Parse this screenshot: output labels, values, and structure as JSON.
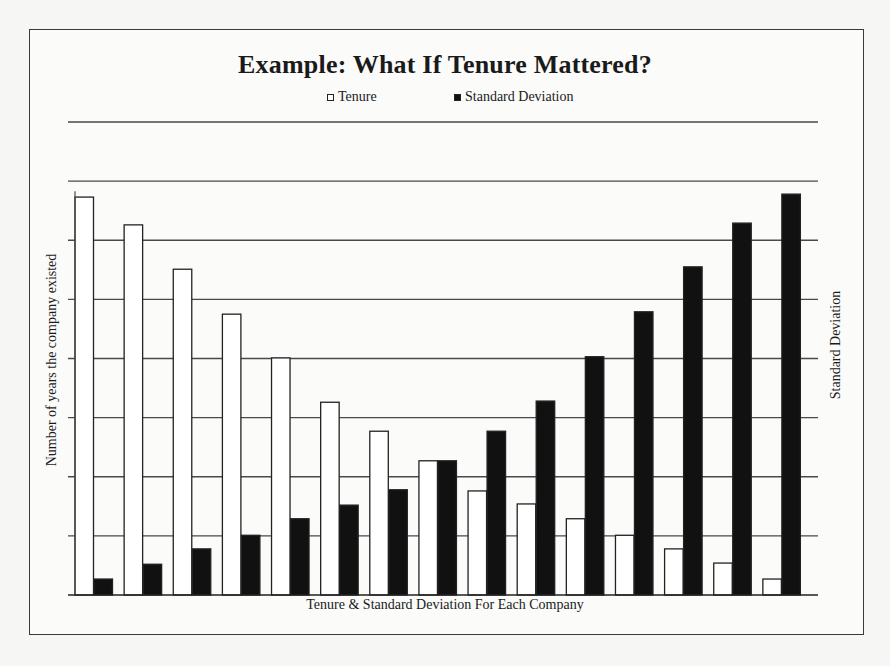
{
  "chart_data": {
    "type": "bar",
    "title": "Example: What If Tenure Mattered?",
    "xlabel": "Tenure & Standard Deviation For Each Company",
    "ylabel": "Number of years the company existed",
    "y2label": "Standard Deviation",
    "categories": [
      "1",
      "2",
      "3",
      "4",
      "5",
      "6",
      "7",
      "8",
      "9",
      "10",
      "11",
      "12",
      "13",
      "14",
      "15"
    ],
    "series": [
      {
        "name": "Tenure",
        "color": "#ffffff",
        "values": [
          6.73,
          6.26,
          5.51,
          4.75,
          4.01,
          3.26,
          2.77,
          2.27,
          1.76,
          1.54,
          1.29,
          1.01,
          0.78,
          0.54,
          0.27
        ]
      },
      {
        "name": "Standard Deviation",
        "color": "#111111",
        "values": [
          0.27,
          0.52,
          0.78,
          1.01,
          1.29,
          1.52,
          1.78,
          2.27,
          2.77,
          3.28,
          4.03,
          4.79,
          5.55,
          6.29,
          6.78
        ]
      }
    ],
    "ylim": [
      0,
      8
    ],
    "grid": true,
    "gridlines": 8,
    "tick_labels_shown": false,
    "legend_position": "top"
  },
  "header": {
    "title": "Example: What If Tenure Mattered?",
    "legend": [
      {
        "label": "Tenure",
        "swatch": "white"
      },
      {
        "label": "Standard Deviation",
        "swatch": "black"
      }
    ]
  },
  "axes": {
    "left_label": "Number of years the company existed",
    "right_label": "Standard Deviation",
    "bottom_label": "Tenure & Standard Deviation For Each Company"
  },
  "colors": {
    "background": "#f6f6f5",
    "frame": "#3a3a3a",
    "gridline": "#4a4a4a",
    "tenure_fill": "#ffffff",
    "sd_fill": "#111111"
  }
}
